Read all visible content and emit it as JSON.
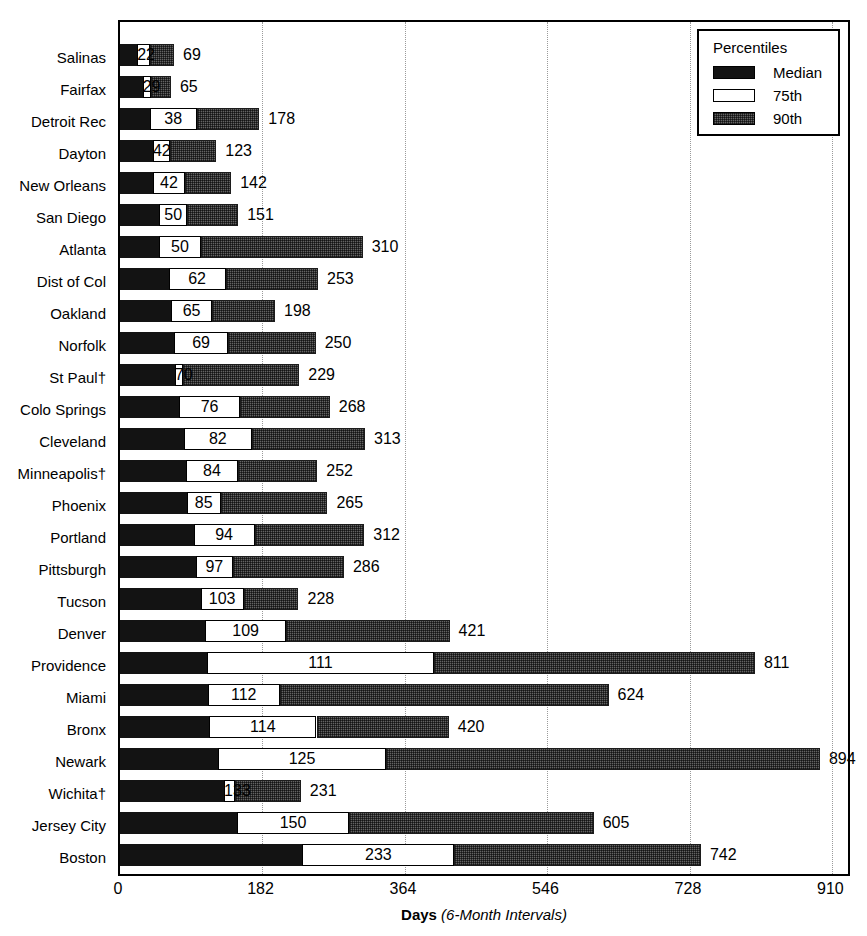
{
  "chart_data": {
    "type": "bar",
    "orientation": "horizontal",
    "stacked": true,
    "title": "",
    "xlabel_bold": "Days",
    "xlabel_italic": "(6-Month Intervals)",
    "ylabel": "",
    "xlim": [
      0,
      935
    ],
    "xticks": [
      0,
      182,
      364,
      546,
      728,
      910
    ],
    "xtick_labels": [
      "0",
      "182",
      "364",
      "546",
      "728",
      "910"
    ],
    "grid": "vertical-dotted",
    "legend": {
      "position": "top-right",
      "title": "Percentiles",
      "entries": [
        {
          "label": "Median",
          "swatch": "black",
          "color": "#131313"
        },
        {
          "label": "75th",
          "swatch": "white",
          "color": "#ffffff"
        },
        {
          "label": "90th",
          "swatch": "hatched-gray",
          "color": "#636363"
        }
      ]
    },
    "categories": [
      "Salinas",
      "Fairfax",
      "Detroit Rec",
      "Dayton",
      "New Orleans",
      "San Diego",
      "Atlanta",
      "Dist of Col",
      "Oakland",
      "Norfolk",
      "St Paul†",
      "Colo Springs",
      "Cleveland",
      "Minneapolis†",
      "Phoenix",
      "Portland",
      "Pittsburgh",
      "Tucson",
      "Denver",
      "Providence",
      "Miami",
      "Bronx",
      "Newark",
      "Wichita†",
      "Jersey City",
      "Boston"
    ],
    "series": [
      {
        "name": "Median",
        "values": [
          22,
          29,
          38,
          42,
          42,
          50,
          50,
          62,
          65,
          69,
          70,
          76,
          82,
          84,
          85,
          94,
          97,
          103,
          109,
          111,
          112,
          114,
          125,
          133,
          150,
          233
        ]
      },
      {
        "name": "75th",
        "values": [
          38,
          40,
          98,
          64,
          83,
          86,
          103,
          135,
          118,
          138,
          80,
          153,
          168,
          151,
          129,
          172,
          144,
          158,
          212,
          401,
          204,
          251,
          340,
          147,
          292,
          427
        ]
      },
      {
        "name": "90th",
        "values": [
          69,
          65,
          178,
          123,
          142,
          151,
          310,
          253,
          198,
          250,
          229,
          268,
          313,
          252,
          265,
          312,
          286,
          228,
          421,
          811,
          624,
          420,
          894,
          231,
          605,
          742
        ]
      }
    ],
    "rows": [
      {
        "category": "Salinas",
        "median": 22,
        "p75": 38,
        "p90": 69,
        "p90_label": "69"
      },
      {
        "category": "Fairfax",
        "median": 29,
        "p75": 40,
        "p90": 65,
        "p90_label": "65"
      },
      {
        "category": "Detroit Rec",
        "median": 38,
        "p75": 98,
        "p90": 178,
        "p90_label": "178"
      },
      {
        "category": "Dayton",
        "median": 42,
        "p75": 64,
        "p90": 123,
        "p90_label": "123"
      },
      {
        "category": "New Orleans",
        "median": 42,
        "p75": 83,
        "p90": 142,
        "p90_label": "142"
      },
      {
        "category": "San Diego",
        "median": 50,
        "p75": 86,
        "p90": 151,
        "p90_label": "151"
      },
      {
        "category": "Atlanta",
        "median": 50,
        "p75": 103,
        "p90": 310,
        "p90_label": "310"
      },
      {
        "category": "Dist of Col",
        "median": 62,
        "p75": 135,
        "p90": 253,
        "p90_label": "253"
      },
      {
        "category": "Oakland",
        "median": 65,
        "p75": 118,
        "p90": 198,
        "p90_label": "198"
      },
      {
        "category": "Norfolk",
        "median": 69,
        "p75": 138,
        "p90": 250,
        "p90_label": "250"
      },
      {
        "category": "St Paul†",
        "median": 70,
        "p75": 80,
        "p90": 229,
        "p90_label": "229"
      },
      {
        "category": "Colo Springs",
        "median": 76,
        "p75": 153,
        "p90": 268,
        "p90_label": "268"
      },
      {
        "category": "Cleveland",
        "median": 82,
        "p75": 168,
        "p90": 313,
        "p90_label": "313"
      },
      {
        "category": "Minneapolis†",
        "median": 84,
        "p75": 151,
        "p90": 252,
        "p90_label": "252"
      },
      {
        "category": "Phoenix",
        "median": 85,
        "p75": 129,
        "p90": 265,
        "p90_label": "265"
      },
      {
        "category": "Portland",
        "median": 94,
        "p75": 172,
        "p90": 312,
        "p90_label": "312"
      },
      {
        "category": "Pittsburgh",
        "median": 97,
        "p75": 144,
        "p90": 286,
        "p90_label": "286"
      },
      {
        "category": "Tucson",
        "median": 103,
        "p75": 158,
        "p90": 228,
        "p90_label": "228"
      },
      {
        "category": "Denver",
        "median": 109,
        "p75": 212,
        "p90": 421,
        "p90_label": "421"
      },
      {
        "category": "Providence",
        "median": 111,
        "p75": 401,
        "p90": 811,
        "p90_label": "811"
      },
      {
        "category": "Miami",
        "median": 112,
        "p75": 204,
        "p90": 624,
        "p90_label": "624"
      },
      {
        "category": "Bronx",
        "median": 114,
        "p75": 251,
        "p90": 420,
        "p90_label": "420"
      },
      {
        "category": "Newark",
        "median": 125,
        "p75": 340,
        "p90": 894,
        "p90_label": "894"
      },
      {
        "category": "Wichita†",
        "median": 133,
        "p75": 147,
        "p90": 231,
        "p90_label": "231"
      },
      {
        "category": "Jersey City",
        "median": 150,
        "p75": 292,
        "p90": 605,
        "p90_label": "605"
      },
      {
        "category": "Boston",
        "median": 233,
        "p75": 427,
        "p90": 742,
        "p90_label": "742"
      }
    ]
  },
  "colors": {
    "median": "#131313",
    "p75": "#ffffff",
    "p90": "#636363",
    "axis": "#000000",
    "grid": "#9a9a9a"
  }
}
